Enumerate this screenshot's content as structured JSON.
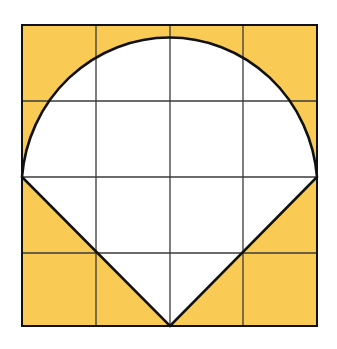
{
  "figure": {
    "grid": {
      "rows": 4,
      "cols": 4
    },
    "colors": {
      "shaded": "#F9CB55",
      "region": "#FFFFFF",
      "grid_line": "#3a3a3a",
      "outline": "#111111",
      "background": "#FFFFFF"
    },
    "geometry": {
      "square": {
        "x": 22,
        "y": 25,
        "width": 295,
        "height": 301
      },
      "arc_center": {
        "x": 170,
        "y": 177
      },
      "arc_radius_x": 147,
      "arc_radius_y": 152,
      "apex": {
        "x": 170,
        "y": 326
      }
    }
  }
}
